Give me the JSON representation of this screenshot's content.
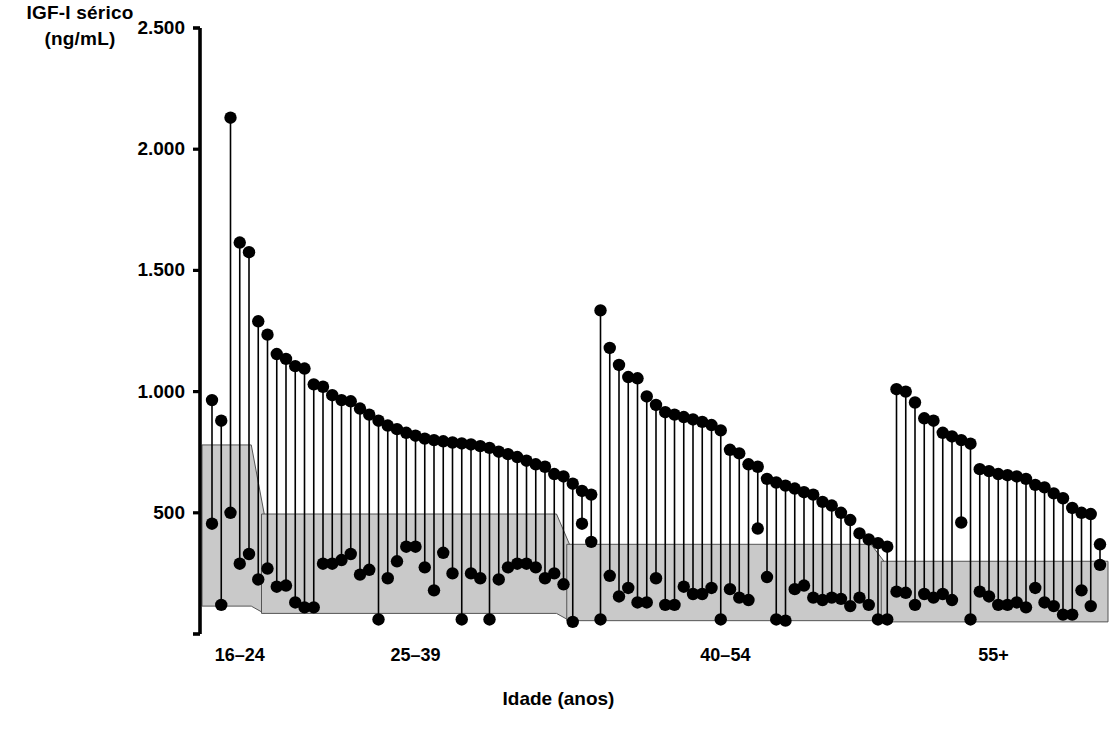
{
  "figure": {
    "background": "#ffffff",
    "ink_color": "#000000",
    "band_color": "#c9c9c9",
    "band_edge_color": "#555555"
  },
  "axes": {
    "y_title_line1": "IGF-I sérico",
    "y_title_line2": "(ng/mL)",
    "x_title": "Idade (anos)",
    "y_ticks": [
      "2.500",
      "2.000",
      "1.500",
      "1.000",
      "500"
    ],
    "y_tick_values": [
      2500,
      2000,
      1500,
      1000,
      500
    ],
    "y_min": 0,
    "y_max": 2500,
    "group_labels": [
      "16–24",
      "25–39",
      "40–54",
      "55+"
    ]
  },
  "chart_data": {
    "type": "scatter",
    "title": "",
    "subtitle": "",
    "xlabel": "Idade (anos)",
    "ylabel": "IGF-I sérico (ng/mL)",
    "ylim": [
      0,
      2500
    ],
    "yticks": [
      500,
      1000,
      1500,
      2000,
      2500
    ],
    "ytick_labels": [
      "500",
      "1.000",
      "1.500",
      "2.000",
      "2.500"
    ],
    "grid": false,
    "legend": "none",
    "x_categories": [
      "16–24",
      "25–39",
      "40–54",
      "55+"
    ],
    "reference_bands": [
      {
        "group": "16-24",
        "x_start": 0,
        "x_end": 5,
        "upper": 780,
        "lower": 115
      },
      {
        "group": "25-39",
        "x_start": 6,
        "x_end": 38,
        "upper": 495,
        "lower": 85
      },
      {
        "group": "40-54",
        "x_start": 39,
        "x_end": 72,
        "upper": 370,
        "lower": 55
      },
      {
        "group": "55+",
        "x_start": 73,
        "x_end": 96,
        "upper": 300,
        "lower": 50
      }
    ],
    "series": [
      {
        "name": "Pré-tratamento",
        "role": "upper-dot"
      },
      {
        "name": "Pós-tratamento",
        "role": "lower-dot"
      }
    ],
    "pairs": [
      {
        "group": "16–24",
        "pre": 965,
        "post": 455
      },
      {
        "group": "16–24",
        "pre": 880,
        "post": 120
      },
      {
        "group": "16–24",
        "pre": 2130,
        "post": 500
      },
      {
        "group": "16–24",
        "pre": 1615,
        "post": 290
      },
      {
        "group": "16–24",
        "pre": 1575,
        "post": 330
      },
      {
        "group": "16–24",
        "pre": 1290,
        "post": 225
      },
      {
        "group": "16–24",
        "pre": 1235,
        "post": 270
      },
      {
        "group": "16–24",
        "pre": 1155,
        "post": 195
      },
      {
        "group": "16–24",
        "pre": 1135,
        "post": 200
      },
      {
        "group": "16–24",
        "pre": 1105,
        "post": 130
      },
      {
        "group": "16–24",
        "pre": 1095,
        "post": 110
      },
      {
        "group": "25–39",
        "pre": 1030,
        "post": 110
      },
      {
        "group": "25–39",
        "pre": 1020,
        "post": 290
      },
      {
        "group": "25–39",
        "pre": 985,
        "post": 290
      },
      {
        "group": "25–39",
        "pre": 965,
        "post": 305
      },
      {
        "group": "25–39",
        "pre": 960,
        "post": 330
      },
      {
        "group": "25–39",
        "pre": 930,
        "post": 245
      },
      {
        "group": "25–39",
        "pre": 905,
        "post": 265
      },
      {
        "group": "25–39",
        "pre": 880,
        "post": 60
      },
      {
        "group": "25–39",
        "pre": 860,
        "post": 230
      },
      {
        "group": "25–39",
        "pre": 845,
        "post": 300
      },
      {
        "group": "25–39",
        "pre": 830,
        "post": 360
      },
      {
        "group": "25–39",
        "pre": 818,
        "post": 360
      },
      {
        "group": "25–39",
        "pre": 806,
        "post": 275
      },
      {
        "group": "25–39",
        "pre": 800,
        "post": 180
      },
      {
        "group": "25–39",
        "pre": 795,
        "post": 335
      },
      {
        "group": "25–39",
        "pre": 790,
        "post": 250
      },
      {
        "group": "25–39",
        "pre": 786,
        "post": 60
      },
      {
        "group": "25–39",
        "pre": 782,
        "post": 250
      },
      {
        "group": "25–39",
        "pre": 775,
        "post": 230
      },
      {
        "group": "25–39",
        "pre": 768,
        "post": 60
      },
      {
        "group": "25–39",
        "pre": 752,
        "post": 225
      },
      {
        "group": "25–39",
        "pre": 742,
        "post": 275
      },
      {
        "group": "25–39",
        "pre": 730,
        "post": 290
      },
      {
        "group": "25–39",
        "pre": 715,
        "post": 290
      },
      {
        "group": "25–39",
        "pre": 700,
        "post": 275
      },
      {
        "group": "25–39",
        "pre": 690,
        "post": 230
      },
      {
        "group": "25–39",
        "pre": 660,
        "post": 250
      },
      {
        "group": "25–39",
        "pre": 650,
        "post": 205
      },
      {
        "group": "25–39",
        "pre": 620,
        "post": 50
      },
      {
        "group": "25–39",
        "pre": 590,
        "post": 455
      },
      {
        "group": "25–39",
        "pre": 575,
        "post": 380
      },
      {
        "group": "40–54",
        "pre": 1335,
        "post": 60
      },
      {
        "group": "40–54",
        "pre": 1180,
        "post": 240
      },
      {
        "group": "40–54",
        "pre": 1110,
        "post": 155
      },
      {
        "group": "40–54",
        "pre": 1060,
        "post": 190
      },
      {
        "group": "40–54",
        "pre": 1055,
        "post": 130
      },
      {
        "group": "40–54",
        "pre": 980,
        "post": 130
      },
      {
        "group": "40–54",
        "pre": 945,
        "post": 230
      },
      {
        "group": "40–54",
        "pre": 915,
        "post": 120
      },
      {
        "group": "40–54",
        "pre": 905,
        "post": 120
      },
      {
        "group": "40–54",
        "pre": 895,
        "post": 195
      },
      {
        "group": "40–54",
        "pre": 885,
        "post": 165
      },
      {
        "group": "40–54",
        "pre": 875,
        "post": 165
      },
      {
        "group": "40–54",
        "pre": 862,
        "post": 190
      },
      {
        "group": "40–54",
        "pre": 840,
        "post": 60
      },
      {
        "group": "40–54",
        "pre": 760,
        "post": 185
      },
      {
        "group": "40–54",
        "pre": 745,
        "post": 150
      },
      {
        "group": "40–54",
        "pre": 700,
        "post": 140
      },
      {
        "group": "40–54",
        "pre": 690,
        "post": 435
      },
      {
        "group": "40–54",
        "pre": 640,
        "post": 235
      },
      {
        "group": "40–54",
        "pre": 625,
        "post": 60
      },
      {
        "group": "40–54",
        "pre": 612,
        "post": 55
      },
      {
        "group": "40–54",
        "pre": 600,
        "post": 185
      },
      {
        "group": "40–54",
        "pre": 585,
        "post": 200
      },
      {
        "group": "40–54",
        "pre": 575,
        "post": 150
      },
      {
        "group": "40–54",
        "pre": 545,
        "post": 140
      },
      {
        "group": "40–54",
        "pre": 530,
        "post": 150
      },
      {
        "group": "40–54",
        "pre": 500,
        "post": 145
      },
      {
        "group": "40–54",
        "pre": 470,
        "post": 115
      },
      {
        "group": "40–54",
        "pre": 415,
        "post": 150
      },
      {
        "group": "40–54",
        "pre": 390,
        "post": 120
      },
      {
        "group": "40–54",
        "pre": 375,
        "post": 60
      },
      {
        "group": "40–54",
        "pre": 360,
        "post": 60
      },
      {
        "group": "55+",
        "pre": 1010,
        "post": 175
      },
      {
        "group": "55+",
        "pre": 1000,
        "post": 170
      },
      {
        "group": "55+",
        "pre": 955,
        "post": 120
      },
      {
        "group": "55+",
        "pre": 890,
        "post": 165
      },
      {
        "group": "55+",
        "pre": 880,
        "post": 150
      },
      {
        "group": "55+",
        "pre": 830,
        "post": 165
      },
      {
        "group": "55+",
        "pre": 815,
        "post": 140
      },
      {
        "group": "55+",
        "pre": 800,
        "post": 460
      },
      {
        "group": "55+",
        "pre": 785,
        "post": 60
      },
      {
        "group": "55+",
        "pre": 680,
        "post": 175
      },
      {
        "group": "55+",
        "pre": 672,
        "post": 155
      },
      {
        "group": "55+",
        "pre": 660,
        "post": 120
      },
      {
        "group": "55+",
        "pre": 655,
        "post": 120
      },
      {
        "group": "55+",
        "pre": 650,
        "post": 130
      },
      {
        "group": "55+",
        "pre": 640,
        "post": 110
      },
      {
        "group": "55+",
        "pre": 615,
        "post": 190
      },
      {
        "group": "55+",
        "pre": 605,
        "post": 130
      },
      {
        "group": "55+",
        "pre": 580,
        "post": 115
      },
      {
        "group": "55+",
        "pre": 560,
        "post": 80
      },
      {
        "group": "55+",
        "pre": 520,
        "post": 80
      },
      {
        "group": "55+",
        "pre": 500,
        "post": 180
      },
      {
        "group": "55+",
        "pre": 495,
        "post": 115
      },
      {
        "group": "55+",
        "pre": 370,
        "post": 285
      }
    ]
  }
}
